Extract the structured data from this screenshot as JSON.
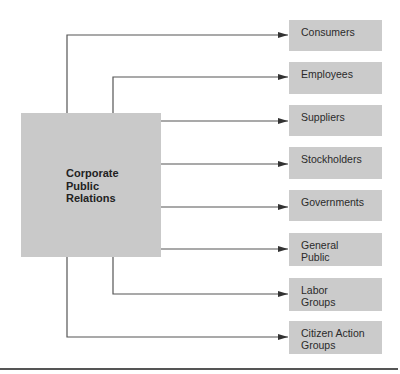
{
  "diagram": {
    "type": "hub-and-spoke flow diagram",
    "source": {
      "label": "Corporate\nPublic\nRelations",
      "fill": "#c9c9c9"
    },
    "targets": [
      {
        "label": "Consumers"
      },
      {
        "label": "Employees"
      },
      {
        "label": "Suppliers"
      },
      {
        "label": "Stockholders"
      },
      {
        "label": "Governments"
      },
      {
        "label": "General\nPublic"
      },
      {
        "label": "Labor\nGroups"
      },
      {
        "label": "Citizen Action\nGroups"
      }
    ],
    "edges": [
      {
        "from": "Corporate Public Relations",
        "to": "Consumers",
        "route": "top, left branch"
      },
      {
        "from": "Corporate Public Relations",
        "to": "Employees",
        "route": "top, right branch"
      },
      {
        "from": "Corporate Public Relations",
        "to": "Suppliers",
        "route": "right side"
      },
      {
        "from": "Corporate Public Relations",
        "to": "Stockholders",
        "route": "right side"
      },
      {
        "from": "Corporate Public Relations",
        "to": "Governments",
        "route": "right side"
      },
      {
        "from": "Corporate Public Relations",
        "to": "General Public",
        "route": "right side"
      },
      {
        "from": "Corporate Public Relations",
        "to": "Labor Groups",
        "route": "bottom, right branch"
      },
      {
        "from": "Corporate Public Relations",
        "to": "Citizen Action Groups",
        "route": "bottom, left branch"
      }
    ],
    "colors": {
      "box_fill": "#cbcbcb",
      "line": "#4a4a4a",
      "text": "#2a2a2a"
    }
  }
}
